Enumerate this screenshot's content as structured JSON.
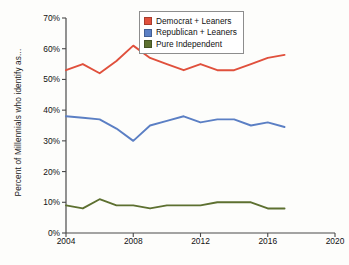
{
  "chart_data": {
    "type": "line",
    "title": "",
    "subtitle": "",
    "xlabel": "",
    "ylabel": "Percent of Millennials who identify as...",
    "xlim": [
      2004,
      2020
    ],
    "ylim": [
      0,
      70
    ],
    "grid": false,
    "legend_position": "top-center",
    "x_ticks": [
      "2004",
      "2008",
      "2012",
      "2016",
      "2020"
    ],
    "y_ticks": [
      "0%",
      "10%",
      "20%",
      "30%",
      "40%",
      "50%",
      "60%",
      "70%"
    ],
    "x": [
      2004,
      2005,
      2006,
      2007,
      2008,
      2009,
      2010,
      2011,
      2012,
      2013,
      2014,
      2015,
      2016,
      2017
    ],
    "series": [
      {
        "name": "Democrat + Leaners",
        "color": "#e0503c",
        "values": [
          53,
          55,
          52,
          56,
          61,
          57,
          55,
          53,
          55,
          53,
          53,
          55,
          57,
          58
        ]
      },
      {
        "name": "Republican + Leaners",
        "color": "#5b7fc4",
        "values": [
          38,
          37.5,
          37,
          34,
          30,
          35,
          36.5,
          38,
          36,
          37,
          37,
          35,
          36,
          34.5
        ]
      },
      {
        "name": "Pure Independent",
        "color": "#5d7030",
        "values": [
          9,
          8,
          11,
          9,
          9,
          8,
          9,
          9,
          9,
          10,
          10,
          10,
          8,
          8
        ]
      }
    ]
  },
  "axis": {
    "y_title": "Percent of Millennials who identify as...",
    "y_ticks": [
      "70%",
      "60%",
      "50%",
      "40%",
      "30%",
      "20%",
      "10%",
      "0%"
    ],
    "x_ticks": [
      "2004",
      "2008",
      "2012",
      "2016",
      "2020"
    ]
  },
  "legend": {
    "items": [
      {
        "label": "Democrat + Leaners",
        "color": "#e0503c"
      },
      {
        "label": "Republican + Leaners",
        "color": "#5b7fc4"
      },
      {
        "label": "Pure Independent",
        "color": "#5d7030"
      }
    ]
  }
}
